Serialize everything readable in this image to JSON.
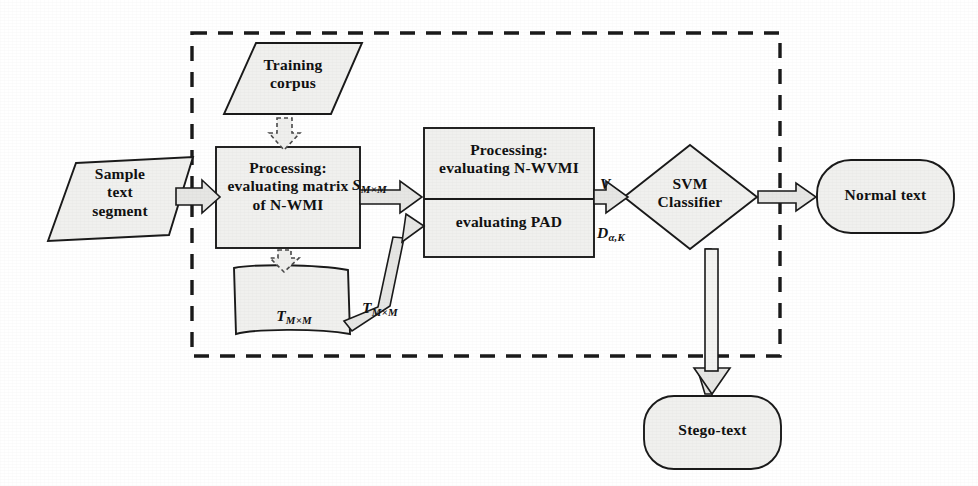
{
  "diagram": {
    "background_color": "#ffffff",
    "shape_fill": "#f0f0ee",
    "stroke_color": "#1a1a1a",
    "dashed_group_label": ""
  },
  "nodes": {
    "sample_text": {
      "label": "Sample\ntext\nsegment",
      "shape": "parallelogram"
    },
    "training_corpus": {
      "label": "Training\ncorpus",
      "shape": "parallelogram"
    },
    "processing_nwmi": {
      "label": "Processing:\nevaluating matrix\nof N-WMI",
      "shape": "rectangle"
    },
    "processing_nwvmi": {
      "label": "Processing:\nevaluating N-WVMI",
      "shape": "rectangle-top"
    },
    "evaluating_pad": {
      "label": "evaluating PAD",
      "shape": "rectangle-bottom"
    },
    "data_store": {
      "label_main": "T",
      "label_sub": "M×M",
      "shape": "document"
    },
    "svm_classifier": {
      "label": "SVM\nClassifier",
      "shape": "diamond"
    },
    "normal_text": {
      "label": "Normal text",
      "shape": "rounded-rectangle"
    },
    "stego_text": {
      "label": "Stego-text",
      "shape": "rounded-rectangle"
    }
  },
  "edge_labels": {
    "s_matrix": {
      "main": "S",
      "sub": "M×M"
    },
    "t_matrix_feedback": {
      "main": "T",
      "sub": "M×M"
    },
    "v_vector": {
      "main": "V",
      "sub": ""
    },
    "d_alpha_k": {
      "main": "D",
      "sub": "α,K"
    }
  },
  "edges": [
    {
      "from": "sample_text",
      "to": "processing_nwmi",
      "style": "block-arrow-solid"
    },
    {
      "from": "training_corpus",
      "to": "processing_nwmi",
      "style": "block-arrow-dashed"
    },
    {
      "from": "processing_nwmi",
      "to": "data_store",
      "style": "block-arrow-dashed"
    },
    {
      "from": "processing_nwmi",
      "to": "processing_nwvmi",
      "style": "block-arrow-solid",
      "label": "s_matrix"
    },
    {
      "from": "data_store",
      "to": "processing_nwvmi",
      "style": "block-arrow-solid-diagonal",
      "label": "t_matrix_feedback"
    },
    {
      "from": "processing_nwvmi",
      "to": "svm_classifier",
      "style": "block-arrow-solid",
      "label": "v_vector"
    },
    {
      "from": "evaluating_pad",
      "to": "svm_classifier",
      "style": "block-arrow-solid",
      "label": "d_alpha_k"
    },
    {
      "from": "svm_classifier",
      "to": "normal_text",
      "style": "block-arrow-solid"
    },
    {
      "from": "svm_classifier",
      "to": "stego_text",
      "style": "block-arrow-solid-vertical"
    }
  ]
}
